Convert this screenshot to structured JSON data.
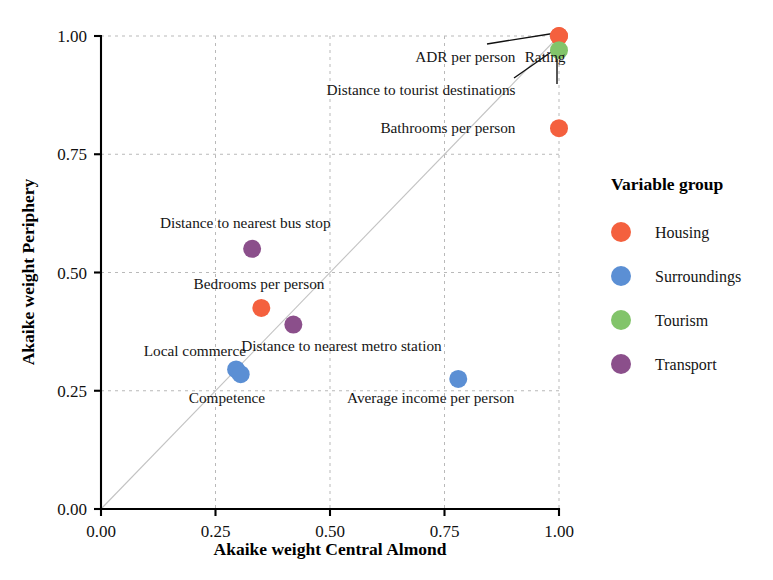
{
  "chart_data": {
    "type": "scatter",
    "title": "",
    "xlabel": "Akaike weight Central Almond",
    "ylabel": "Akaike weight Periphery",
    "xlim": [
      0.0,
      1.0
    ],
    "ylim": [
      0.0,
      1.0
    ],
    "xticks": [
      "0.00",
      "0.25",
      "0.50",
      "0.75",
      "1.00"
    ],
    "yticks": [
      "0.00",
      "0.25",
      "0.50",
      "0.75",
      "1.00"
    ],
    "xtick_values": [
      0.0,
      0.25,
      0.5,
      0.75,
      1.0
    ],
    "ytick_values": [
      0.0,
      0.25,
      0.5,
      0.75,
      1.0
    ],
    "grid": true,
    "reference_line": {
      "type": "identity",
      "label": "y = x",
      "color": "#c3c3c3"
    },
    "legend": {
      "title": "Variable group",
      "position": "right",
      "entries": [
        {
          "name": "Housing",
          "color": "#F4603E"
        },
        {
          "name": "Surroundings",
          "color": "#5B8FD4"
        },
        {
          "name": "Tourism",
          "color": "#82C46A"
        },
        {
          "name": "Transport",
          "color": "#8B4F8B"
        }
      ]
    },
    "points": [
      {
        "label": "ADR per person",
        "x": 1.0,
        "y": 1.0,
        "group": "Housing",
        "color": "#F4603E"
      },
      {
        "label": "Rating",
        "x": 1.0,
        "y": 1.0,
        "group": "Housing",
        "color": "#F4603E"
      },
      {
        "label": "Distance to tourist destinations",
        "x": 1.0,
        "y": 0.97,
        "group": "Tourism",
        "color": "#82C46A"
      },
      {
        "label": "Bathrooms per person",
        "x": 1.0,
        "y": 0.805,
        "group": "Housing",
        "color": "#F4603E"
      },
      {
        "label": "Distance to nearest bus stop",
        "x": 0.33,
        "y": 0.55,
        "group": "Transport",
        "color": "#8B4F8B"
      },
      {
        "label": "Bedrooms per person",
        "x": 0.35,
        "y": 0.425,
        "group": "Housing",
        "color": "#F4603E"
      },
      {
        "label": "Distance to nearest metro station",
        "x": 0.42,
        "y": 0.39,
        "group": "Transport",
        "color": "#8B4F8B"
      },
      {
        "label": "Local commerce",
        "x": 0.295,
        "y": 0.295,
        "group": "Surroundings",
        "color": "#5B8FD4"
      },
      {
        "label": "Competence",
        "x": 0.305,
        "y": 0.285,
        "group": "Surroundings",
        "color": "#5B8FD4"
      },
      {
        "label": "Average income per person",
        "x": 0.78,
        "y": 0.275,
        "group": "Surroundings",
        "color": "#5B8FD4"
      }
    ],
    "annotations": [
      {
        "text": "ADR per person",
        "anchor_x": 0.905,
        "anchor_y": 0.955,
        "align": "end",
        "leader_to": [
          1.0,
          1.0
        ]
      },
      {
        "text": "Rating",
        "anchor_x": 0.925,
        "anchor_y": 0.955,
        "align": "start",
        "leader_to": [
          1.0,
          0.97
        ]
      },
      {
        "text": "Distance to tourist destinations",
        "anchor_x": 0.905,
        "anchor_y": 0.885,
        "align": "end",
        "leader_to": null
      },
      {
        "text": "Bathrooms per person",
        "anchor_x": 0.905,
        "anchor_y": 0.805,
        "align": "end",
        "leader_to": null
      },
      {
        "text": "Distance to nearest bus stop",
        "anchor_x": 0.315,
        "anchor_y": 0.605,
        "align": "middle",
        "leader_to": null
      },
      {
        "text": "Bedrooms per person",
        "anchor_x": 0.345,
        "anchor_y": 0.475,
        "align": "middle",
        "leader_to": null
      },
      {
        "text": "Distance to nearest metro station",
        "anchor_x": 0.525,
        "anchor_y": 0.345,
        "align": "middle",
        "leader_to": null
      },
      {
        "text": "Local commerce",
        "anchor_x": 0.205,
        "anchor_y": 0.335,
        "align": "middle",
        "leader_to": null
      },
      {
        "text": "Competence",
        "anchor_x": 0.275,
        "anchor_y": 0.235,
        "align": "middle",
        "leader_to": null
      },
      {
        "text": "Average income per person",
        "anchor_x": 0.72,
        "anchor_y": 0.235,
        "align": "middle",
        "leader_to": null
      }
    ]
  }
}
